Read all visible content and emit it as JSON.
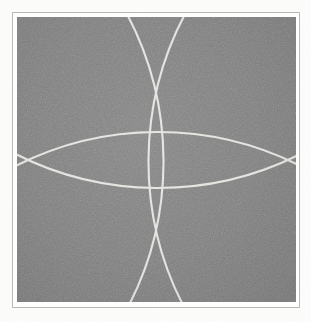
{
  "figure": {
    "kind": "geometric-line-figure",
    "caption": "",
    "page_background": "#fdfdfc",
    "panel_background": "#808080",
    "line_color": "#e2e2de",
    "frame_color": "#b9b9b6",
    "frame_inner_color": "#ffffff"
  },
  "plate": {
    "frame": {
      "x": 12,
      "y": 12,
      "width": 288,
      "height": 296
    },
    "panel": {
      "x": 17,
      "y": 17,
      "width": 279,
      "height": 285
    }
  },
  "chart_data": {
    "type": "diagram",
    "title": "",
    "xlabel": "",
    "ylabel": "",
    "grid": false,
    "legend": "none",
    "geometry": "four-arc-rosette",
    "panel_bounds": {
      "x0": 17,
      "y0": 17,
      "x1": 296,
      "y1": 302
    },
    "cusps": [
      {
        "name": "top-cusp",
        "x": 156,
        "y": 93
      },
      {
        "name": "bottom-cusp",
        "x": 156,
        "y": 230
      },
      {
        "name": "left-cusp",
        "x": 28,
        "y": 160
      },
      {
        "name": "right-cusp",
        "x": 288,
        "y": 160
      }
    ],
    "star_vertices": [
      {
        "name": "upper-left-point",
        "x": 88,
        "y": 120
      },
      {
        "name": "upper-right-point",
        "x": 224,
        "y": 120
      },
      {
        "name": "lower-left-point",
        "x": 88,
        "y": 201
      },
      {
        "name": "lower-right-point",
        "x": 224,
        "y": 201
      }
    ],
    "edge_crossings": [
      {
        "edge": "top",
        "x": 118,
        "y": 17
      },
      {
        "edge": "top",
        "x": 194,
        "y": 17
      },
      {
        "edge": "bottom",
        "x": 118,
        "y": 302
      },
      {
        "edge": "bottom",
        "x": 194,
        "y": 302
      },
      {
        "edge": "left",
        "x": 17,
        "y": 120
      },
      {
        "edge": "left",
        "x": 17,
        "y": 201
      },
      {
        "edge": "right",
        "x": 296,
        "y": 120
      },
      {
        "edge": "right",
        "x": 296,
        "y": 201
      }
    ],
    "arcs": [
      {
        "name": "upper-horizontal-arc",
        "orientation": "horizontal",
        "bulge": "up",
        "start": {
          "x": 28,
          "y": 160
        },
        "end": {
          "x": 288,
          "y": 160
        },
        "apex": {
          "x": 156,
          "y": 93
        },
        "radius": 316,
        "sweep": 0
      },
      {
        "name": "lower-horizontal-arc",
        "orientation": "horizontal",
        "bulge": "down",
        "start": {
          "x": 28,
          "y": 160
        },
        "end": {
          "x": 288,
          "y": 160
        },
        "apex": {
          "x": 156,
          "y": 230
        },
        "radius": 316,
        "sweep": 1
      },
      {
        "name": "left-vertical-arc",
        "orientation": "vertical",
        "bulge": "left",
        "start": {
          "x": 156,
          "y": 93
        },
        "end": {
          "x": 156,
          "y": 230
        },
        "apex": {
          "x": 28,
          "y": 160
        },
        "radius": 316,
        "sweep": 1
      },
      {
        "name": "right-vertical-arc",
        "orientation": "vertical",
        "bulge": "right",
        "start": {
          "x": 156,
          "y": 93
        },
        "end": {
          "x": 156,
          "y": 230
        },
        "apex": {
          "x": 288,
          "y": 160
        },
        "radius": 316,
        "sweep": 0
      }
    ],
    "line_width": 2.1,
    "line_color": "#e4e4e0",
    "background_color": "#808080"
  }
}
